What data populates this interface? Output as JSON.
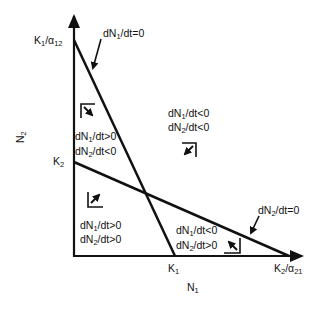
{
  "diagram": {
    "axes": {
      "x_label": {
        "main": "N",
        "sub": "1"
      },
      "y_label": {
        "main": "N",
        "sub": "2"
      }
    },
    "intercepts": {
      "k1_over_a12": {
        "main": "K",
        "sub1": "1",
        "mid": "/α",
        "sub2": "12"
      },
      "k2": {
        "main": "K",
        "sub1": "2"
      },
      "k1": {
        "main": "K",
        "sub1": "1"
      },
      "k2_over_a21": {
        "main": "K",
        "sub1": "2",
        "mid": "/α",
        "sub2": "21"
      }
    },
    "isoclines": {
      "n1": {
        "a": "dN",
        "sub": "1",
        "b": "/dt=0"
      },
      "n2": {
        "a": "dN",
        "sub": "2",
        "b": "/dt=0"
      }
    },
    "regions": {
      "upper_left": {
        "line1": {
          "a": "dN",
          "sub": "1",
          "b": "/dt>0"
        },
        "line2": {
          "a": "dN",
          "sub": "2",
          "b": "/dt<0"
        },
        "arrow_direction": "down-right"
      },
      "upper_right": {
        "line1": {
          "a": "dN",
          "sub": "1",
          "b": "/dt<0"
        },
        "line2": {
          "a": "dN",
          "sub": "2",
          "b": "/dt<0"
        },
        "arrow_direction": "down-left"
      },
      "lower_left": {
        "line1": {
          "a": "dN",
          "sub": "1",
          "b": "/dt>0"
        },
        "line2": {
          "a": "dN",
          "sub": "2",
          "b": "/dt>0"
        },
        "arrow_direction": "up-right"
      },
      "lower_right": {
        "line1": {
          "a": "dN",
          "sub": "1",
          "b": "/dt<0"
        },
        "line2": {
          "a": "dN",
          "sub": "2",
          "b": "/dt>0"
        },
        "arrow_direction": "up-left"
      }
    },
    "colors": {
      "ink": "#111111",
      "background": "#ffffff"
    }
  }
}
